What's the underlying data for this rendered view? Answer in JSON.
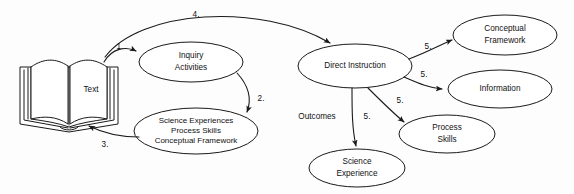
{
  "diagram": {
    "background_color": "#fdfdfd",
    "stroke_color": "#1a1a1a",
    "nodes": {
      "book": {
        "label": "Text",
        "shape": "open-book"
      },
      "inquiry": {
        "line1": "Inquiry",
        "line2": "Activities",
        "shape": "ellipse"
      },
      "science_experiences": {
        "line1": "Science Experiences",
        "line2": "Process Skills",
        "line3": "Conceptual Framework",
        "shape": "ellipse"
      },
      "direct_instruction": {
        "label": "Direct Instruction",
        "shape": "ellipse"
      },
      "conceptual_framework": {
        "line1": "Conceptual",
        "line2": "Framework",
        "shape": "ellipse"
      },
      "information": {
        "label": "Information",
        "shape": "ellipse"
      },
      "process_skills": {
        "line1": "Process",
        "line2": "Skills",
        "shape": "ellipse"
      },
      "science_experience": {
        "line1": "Science",
        "line2": "Experience",
        "shape": "ellipse"
      }
    },
    "edge_labels": {
      "e1": "1.",
      "e2": "2.",
      "e3": "3.",
      "e4": "4.",
      "e5a": "5.",
      "e5b": "5.",
      "e5c": "5.",
      "e5d": "5."
    },
    "group_labels": {
      "outcomes": "Outcomes"
    }
  }
}
